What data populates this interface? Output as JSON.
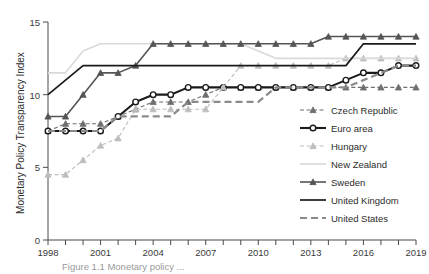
{
  "figure": {
    "caption": "Figure 1.1 Monetary policy ...",
    "background": "#ffffff"
  },
  "chart_data": {
    "type": "line",
    "title": "",
    "xlabel": "",
    "ylabel": "Monetary Policy Transparency Index",
    "xlim": [
      1998,
      2019
    ],
    "ylim": [
      0,
      15
    ],
    "yticks": [
      0,
      5,
      10,
      15
    ],
    "ytick_labels": [
      "0",
      "5",
      "10",
      "15"
    ],
    "xticks": [
      1998,
      1999,
      2000,
      2001,
      2002,
      2003,
      2004,
      2005,
      2006,
      2007,
      2008,
      2009,
      2010,
      2011,
      2012,
      2013,
      2014,
      2015,
      2016,
      2017,
      2018,
      2019
    ],
    "xtick_labels": [
      "1998",
      "",
      "",
      "2001",
      "",
      "",
      "2004",
      "",
      "",
      "2007",
      "",
      "",
      "2010",
      "",
      "",
      "2013",
      "",
      "",
      "2016",
      "",
      "",
      "2019"
    ],
    "grid": false,
    "legend_position": "right",
    "x": [
      1998,
      1999,
      2000,
      2001,
      2002,
      2003,
      2004,
      2005,
      2006,
      2007,
      2008,
      2009,
      2010,
      2011,
      2012,
      2013,
      2014,
      2015,
      2016,
      2017,
      2018,
      2019
    ],
    "series": [
      {
        "name": "Czech Republic",
        "color": "#6e6e6e",
        "style": "dashed",
        "marker": "triangle",
        "width": 1.1,
        "values": [
          7.5,
          8.0,
          8.0,
          8.0,
          8.5,
          9.0,
          9.5,
          9.5,
          9.5,
          10.0,
          10.5,
          10.5,
          10.5,
          10.5,
          10.5,
          10.5,
          10.5,
          10.5,
          10.5,
          10.5,
          10.5,
          10.5
        ]
      },
      {
        "name": "Euro area",
        "color": "#1a1a1a",
        "style": "solid",
        "marker": "circle",
        "width": 2.1,
        "values": [
          7.5,
          7.5,
          7.5,
          7.5,
          8.5,
          9.5,
          10.0,
          10.0,
          10.5,
          10.5,
          10.5,
          10.5,
          10.5,
          10.5,
          10.5,
          10.5,
          10.5,
          11.0,
          11.5,
          11.5,
          12.0,
          12.0
        ]
      },
      {
        "name": "Hungary",
        "color": "#bdbdbd",
        "style": "dashed",
        "marker": "triangle",
        "width": 1.1,
        "values": [
          4.5,
          4.5,
          5.5,
          6.5,
          7.0,
          9.0,
          9.0,
          9.0,
          9.0,
          9.0,
          10.5,
          12.0,
          12.0,
          12.0,
          12.0,
          12.0,
          12.0,
          12.5,
          12.5,
          12.5,
          12.5,
          12.5
        ]
      },
      {
        "name": "New Zealand",
        "color": "#d9d9d9",
        "style": "solid",
        "marker": "none",
        "width": 1.6,
        "values": [
          11.5,
          11.5,
          13.0,
          13.5,
          13.5,
          13.5,
          13.5,
          13.5,
          13.5,
          13.5,
          13.5,
          13.5,
          13.0,
          12.5,
          12.5,
          12.5,
          12.5,
          12.5,
          12.5,
          12.5,
          12.5,
          12.5
        ]
      },
      {
        "name": "Sweden",
        "color": "#555555",
        "style": "solid",
        "marker": "triangle",
        "width": 1.6,
        "values": [
          8.5,
          8.5,
          10.0,
          11.5,
          11.5,
          12.0,
          13.5,
          13.5,
          13.5,
          13.5,
          13.5,
          13.5,
          13.5,
          13.5,
          13.5,
          13.5,
          14.0,
          14.0,
          14.0,
          14.0,
          14.0,
          14.0
        ]
      },
      {
        "name": "United Kingdom",
        "color": "#1a1a1a",
        "style": "solid",
        "marker": "none",
        "width": 1.7,
        "values": [
          10.0,
          11.0,
          12.0,
          12.0,
          12.0,
          12.0,
          12.0,
          12.0,
          12.0,
          12.0,
          12.0,
          12.0,
          12.0,
          12.0,
          12.0,
          12.0,
          12.0,
          12.0,
          13.5,
          13.5,
          13.5,
          13.5
        ]
      },
      {
        "name": "United States",
        "color": "#8a8a8a",
        "style": "longdash",
        "marker": "none",
        "width": 2.2,
        "values": [
          7.5,
          7.5,
          7.5,
          7.5,
          8.5,
          8.5,
          8.5,
          8.5,
          9.5,
          9.5,
          9.5,
          9.5,
          9.5,
          10.5,
          10.5,
          10.5,
          10.5,
          10.5,
          11.0,
          11.5,
          12.0,
          12.0
        ]
      }
    ]
  },
  "legend": {
    "items": [
      {
        "label": "Czech Republic"
      },
      {
        "label": "Euro area"
      },
      {
        "label": "Hungary"
      },
      {
        "label": "New Zealand"
      },
      {
        "label": "Sweden"
      },
      {
        "label": "United Kingdom"
      },
      {
        "label": "United States"
      }
    ]
  }
}
